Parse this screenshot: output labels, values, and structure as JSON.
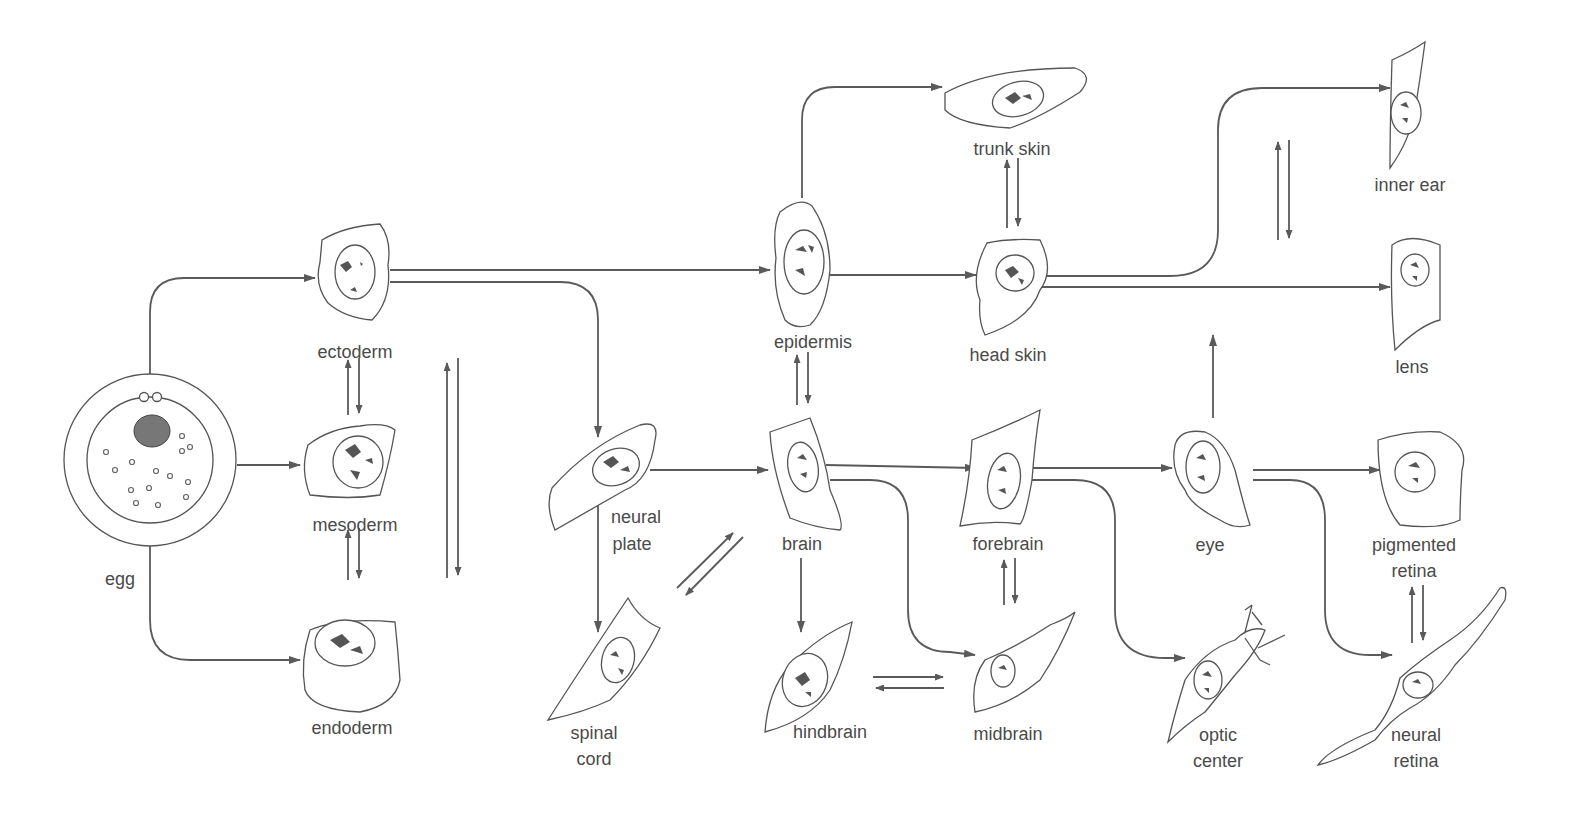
{
  "diagram": {
    "type": "cell-lineage",
    "nodes": [
      {
        "id": "egg",
        "lines": [
          "egg"
        ]
      },
      {
        "id": "ectoderm",
        "lines": [
          "ectoderm"
        ]
      },
      {
        "id": "mesoderm",
        "lines": [
          "mesoderm"
        ]
      },
      {
        "id": "endoderm",
        "lines": [
          "endoderm"
        ]
      },
      {
        "id": "neural_plate",
        "lines": [
          "neural",
          "plate"
        ]
      },
      {
        "id": "spinal_cord",
        "lines": [
          "spinal",
          "cord"
        ]
      },
      {
        "id": "epidermis",
        "lines": [
          "epidermis"
        ]
      },
      {
        "id": "brain",
        "lines": [
          "brain"
        ]
      },
      {
        "id": "hindbrain",
        "lines": [
          "hindbrain"
        ]
      },
      {
        "id": "trunk_skin",
        "lines": [
          "trunk skin"
        ]
      },
      {
        "id": "head_skin",
        "lines": [
          "head skin"
        ]
      },
      {
        "id": "forebrain",
        "lines": [
          "forebrain"
        ]
      },
      {
        "id": "midbrain",
        "lines": [
          "midbrain"
        ]
      },
      {
        "id": "eye",
        "lines": [
          "eye"
        ]
      },
      {
        "id": "optic_center",
        "lines": [
          "optic",
          "center"
        ]
      },
      {
        "id": "inner_ear",
        "lines": [
          "inner ear"
        ]
      },
      {
        "id": "lens",
        "lines": [
          "lens"
        ]
      },
      {
        "id": "pigmented_retina",
        "lines": [
          "pigmented",
          "retina"
        ]
      },
      {
        "id": "neural_retina",
        "lines": [
          "neural",
          "retina"
        ]
      }
    ],
    "edges": [
      {
        "from": "egg",
        "to": "ectoderm"
      },
      {
        "from": "egg",
        "to": "mesoderm"
      },
      {
        "from": "egg",
        "to": "endoderm"
      },
      {
        "from": "ectoderm",
        "to": "epidermis"
      },
      {
        "from": "ectoderm",
        "to": "neural_plate"
      },
      {
        "from": "neural_plate",
        "to": "brain"
      },
      {
        "from": "neural_plate",
        "to": "spinal_cord"
      },
      {
        "from": "epidermis",
        "to": "trunk_skin"
      },
      {
        "from": "epidermis",
        "to": "head_skin"
      },
      {
        "from": "brain",
        "to": "forebrain"
      },
      {
        "from": "brain",
        "to": "midbrain"
      },
      {
        "from": "brain",
        "to": "hindbrain"
      },
      {
        "from": "head_skin",
        "to": "inner_ear"
      },
      {
        "from": "head_skin",
        "to": "lens"
      },
      {
        "from": "forebrain",
        "to": "eye"
      },
      {
        "from": "forebrain",
        "to": "optic_center"
      },
      {
        "from": "eye",
        "to": "pigmented_retina"
      },
      {
        "from": "eye",
        "to": "neural_retina"
      },
      {
        "from": "eye",
        "to": "lens"
      }
    ],
    "reversible_pairs": [
      [
        "ectoderm",
        "mesoderm"
      ],
      [
        "mesoderm",
        "endoderm"
      ],
      [
        "ectoderm",
        "endoderm"
      ],
      [
        "epidermis",
        "brain"
      ],
      [
        "trunk_skin",
        "head_skin"
      ],
      [
        "inner_ear",
        "lens"
      ],
      [
        "spinal_cord",
        "brain"
      ],
      [
        "hindbrain",
        "midbrain"
      ],
      [
        "forebrain",
        "midbrain"
      ],
      [
        "pigmented_retina",
        "neural_retina"
      ]
    ]
  },
  "labels": {
    "egg": "egg",
    "ectoderm": "ectoderm",
    "mesoderm": "mesoderm",
    "endoderm": "endoderm",
    "neural_plate_1": "neural",
    "neural_plate_2": "plate",
    "spinal_cord_1": "spinal",
    "spinal_cord_2": "cord",
    "epidermis": "epidermis",
    "brain": "brain",
    "hindbrain": "hindbrain",
    "trunk_skin": "trunk skin",
    "head_skin": "head skin",
    "forebrain": "forebrain",
    "midbrain": "midbrain",
    "eye": "eye",
    "optic_center_1": "optic",
    "optic_center_2": "center",
    "inner_ear": "inner ear",
    "lens": "lens",
    "pigmented_retina_1": "pigmented",
    "pigmented_retina_2": "retina",
    "neural_retina_1": "neural",
    "neural_retina_2": "retina"
  },
  "colors": {
    "line": "#5a5a5a",
    "text": "#4a4a4a",
    "background": "#ffffff"
  }
}
